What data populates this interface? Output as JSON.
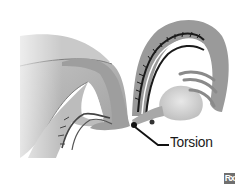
{
  "diagram": {
    "labels": [
      {
        "id": "torsion",
        "text": "Torsion"
      }
    ],
    "badge": {
      "text": "Rx"
    },
    "colors": {
      "background": "#ffffff",
      "tissue_dark": "#8c8c8c",
      "tissue_mid": "#a9a9a9",
      "tissue_light": "#c8c8c8",
      "ovary": "#d9d9d9",
      "outline": "#1a1a1a",
      "label": "#1a1a1a"
    }
  }
}
